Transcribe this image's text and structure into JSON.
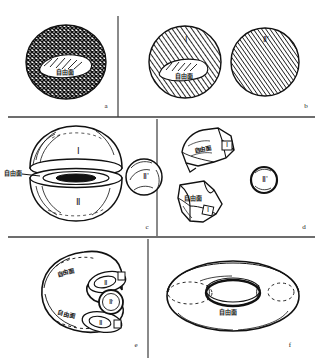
{
  "figure": {
    "title": "",
    "panels": [
      {
        "id": "a",
        "label": "a",
        "caption": "",
        "shape": "sphere-crosshatch",
        "fill_pattern": "cross-hatch",
        "annotations": [
          {
            "name": "free-surface-label",
            "text": "自由面"
          }
        ],
        "regions": []
      },
      {
        "id": "b",
        "label": "b",
        "caption": "",
        "shape": "two-spheres-hatched",
        "fill_pattern": "diagonal-hatch",
        "annotations": [
          {
            "name": "free-surface-label",
            "text": "自由面"
          }
        ],
        "regions": [
          {
            "name": "region-one",
            "text": "Ⅰ"
          },
          {
            "name": "region-two-prime",
            "text": "Ⅱ'"
          }
        ]
      },
      {
        "id": "c",
        "label": "c",
        "caption": "",
        "shape": "split-sphere-hemispheres",
        "fill_pattern": "outline",
        "annotations": [
          {
            "name": "free-surface-label",
            "text": "自由面"
          }
        ],
        "regions": [
          {
            "name": "region-one",
            "text": "Ⅰ"
          },
          {
            "name": "region-two",
            "text": "Ⅱ"
          },
          {
            "name": "region-two-prime",
            "text": "Ⅱ'"
          }
        ]
      },
      {
        "id": "d",
        "label": "d",
        "caption": "",
        "shape": "two-polyhedral-fragments",
        "fill_pattern": "outline",
        "annotations": [
          {
            "name": "free-surface-label-upper",
            "text": "自由面"
          },
          {
            "name": "free-surface-label-lower",
            "text": "自由面"
          }
        ],
        "regions": [
          {
            "name": "region-one-upper",
            "text": "Ⅰ"
          },
          {
            "name": "region-one-lower",
            "text": "Ⅰ"
          },
          {
            "name": "region-two-prime",
            "text": "Ⅱ'"
          }
        ]
      },
      {
        "id": "e",
        "label": "e",
        "caption": "",
        "shape": "horseshoe-body",
        "fill_pattern": "outline",
        "annotations": [
          {
            "name": "free-surface-label-upper",
            "text": "自由面"
          },
          {
            "name": "free-surface-label-lower",
            "text": "自由面"
          }
        ],
        "regions": [
          {
            "name": "region-two-upper",
            "text": "Ⅱ"
          },
          {
            "name": "region-two-lower",
            "text": "Ⅱ"
          },
          {
            "name": "region-two-prime",
            "text": "Ⅱ'"
          }
        ]
      },
      {
        "id": "f",
        "label": "f",
        "caption": "",
        "shape": "torus",
        "fill_pattern": "outline",
        "annotations": [
          {
            "name": "free-surface-label",
            "text": "自由面"
          }
        ],
        "regions": []
      }
    ],
    "colors": {
      "ink": "#1a1a1a",
      "paper": "#ffffff",
      "divider": "#444444"
    }
  }
}
